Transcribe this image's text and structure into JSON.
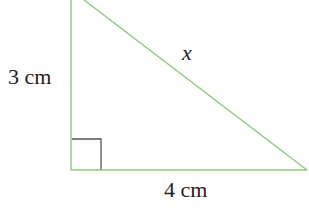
{
  "diagram": {
    "type": "right-triangle",
    "colors": {
      "edge": "#8cc97a",
      "right_angle_marker": "#555555",
      "text": "#222222"
    },
    "labels": {
      "vertical_leg": "3 cm",
      "horizontal_leg": "4 cm",
      "hypotenuse": "x"
    }
  }
}
